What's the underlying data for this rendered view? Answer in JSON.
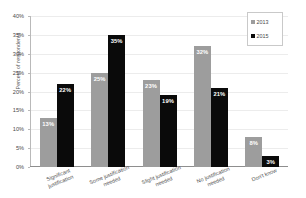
{
  "chart_data": {
    "type": "bar",
    "title": "",
    "xlabel": "",
    "ylabel": "Percent of respondents",
    "ylim": [
      0,
      40
    ],
    "ytick_labels": [
      "40%",
      "35%",
      "30%",
      "25%",
      "20%",
      "15%",
      "10%",
      "5%",
      "0%"
    ],
    "ytick_values": [
      40,
      35,
      30,
      25,
      20,
      15,
      10,
      5,
      0
    ],
    "grid": true,
    "legend_position": "top-right",
    "categories": [
      "Significant justification",
      "Some justification needed",
      "Slight justification needed",
      "No justification needed",
      "Don't know"
    ],
    "category_lines": [
      [
        "Significant",
        "justification"
      ],
      [
        "Some justification",
        "needed"
      ],
      [
        "Slight justification",
        "needed"
      ],
      [
        "No justification",
        "needed"
      ],
      [
        "Don't know",
        ""
      ]
    ],
    "series": [
      {
        "name": "2013",
        "color": "#9d9d9d",
        "values": [
          13,
          25,
          23,
          32,
          8
        ],
        "labels": [
          "13%",
          "25%",
          "23%",
          "32%",
          "8%"
        ]
      },
      {
        "name": "2015",
        "color": "#0a0a0a",
        "values": [
          22,
          35,
          19,
          21,
          3
        ],
        "labels": [
          "22%",
          "35%",
          "19%",
          "21%",
          "3%"
        ]
      }
    ]
  },
  "legend": {
    "items": [
      {
        "label": "2013",
        "color": "#9d9d9d"
      },
      {
        "label": "2015",
        "color": "#0a0a0a"
      }
    ]
  },
  "axes": {
    "y_title": "Percent of respondents"
  }
}
